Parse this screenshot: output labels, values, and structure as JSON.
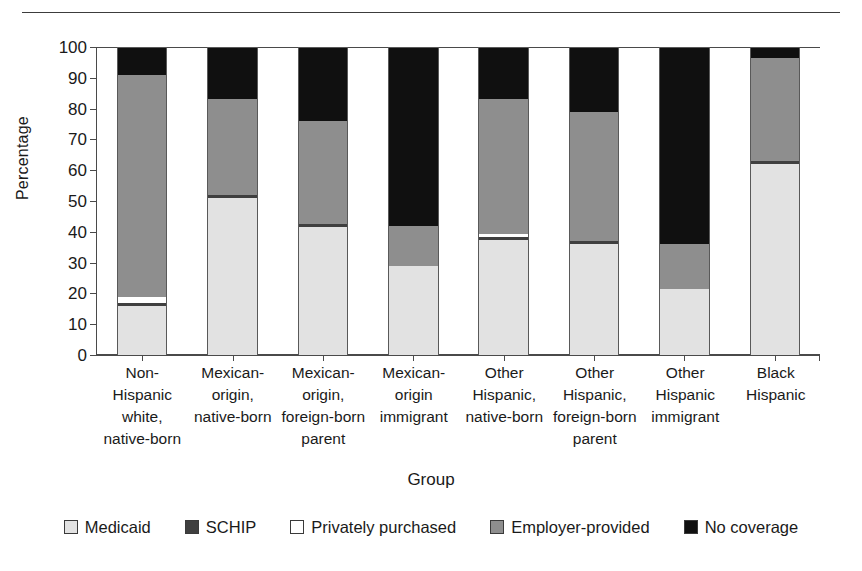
{
  "chart_data": {
    "type": "bar",
    "subtype": "stacked-bar-100",
    "title": "",
    "xlabel": "Group",
    "ylabel": "Percentage",
    "ylim": [
      0,
      100
    ],
    "yticks": [
      0,
      10,
      20,
      30,
      40,
      50,
      60,
      70,
      80,
      90,
      100
    ],
    "grid": false,
    "legend_position": "bottom",
    "categories": [
      "Non-Hispanic\nwhite,\nnative-born",
      "Mexican-\norigin,\nnative-born",
      "Mexican-\norigin,\nforeign-born\nparent",
      "Mexican-\norigin\nimmigrant",
      "Other\nHispanic,\nnative-born",
      "Other\nHispanic,\nforeign-born\nparent",
      "Other\nHispanic\nimmigrant",
      "Black\nHispanic"
    ],
    "series": [
      {
        "name": "Medicaid",
        "color": "#e2e2e2",
        "values": [
          16.0,
          51.0,
          41.5,
          29.0,
          37.5,
          36.0,
          21.5,
          62.0
        ]
      },
      {
        "name": "SCHIP",
        "color": "#3f3f3f",
        "values": [
          1.0,
          1.0,
          1.0,
          0.0,
          0.7,
          1.0,
          0.0,
          1.0
        ]
      },
      {
        "name": "Privately purchased",
        "color": "#ffffff",
        "values": [
          2.0,
          0.0,
          0.0,
          0.0,
          1.0,
          0.0,
          0.0,
          0.0
        ]
      },
      {
        "name": "Employer-provided",
        "color": "#8e8e8e",
        "values": [
          72.0,
          31.0,
          33.5,
          13.0,
          43.8,
          42.0,
          14.5,
          33.5
        ]
      },
      {
        "name": "No coverage",
        "color": "#101010",
        "values": [
          9.0,
          17.0,
          24.0,
          58.0,
          17.0,
          21.0,
          64.0,
          3.5
        ]
      }
    ]
  },
  "axis": {
    "y_title": "Percentage",
    "x_title": "Group",
    "y_tick_labels": [
      "100",
      "90",
      "80",
      "70",
      "60",
      "50",
      "40",
      "30",
      "20",
      "10",
      "0"
    ]
  },
  "legend": {
    "items": [
      {
        "label": "Medicaid",
        "color": "#e2e2e2"
      },
      {
        "label": "SCHIP",
        "color": "#3f3f3f"
      },
      {
        "label": "Privately purchased",
        "color": "#ffffff"
      },
      {
        "label": "Employer-provided",
        "color": "#8e8e8e"
      },
      {
        "label": "No coverage",
        "color": "#101010"
      }
    ]
  }
}
